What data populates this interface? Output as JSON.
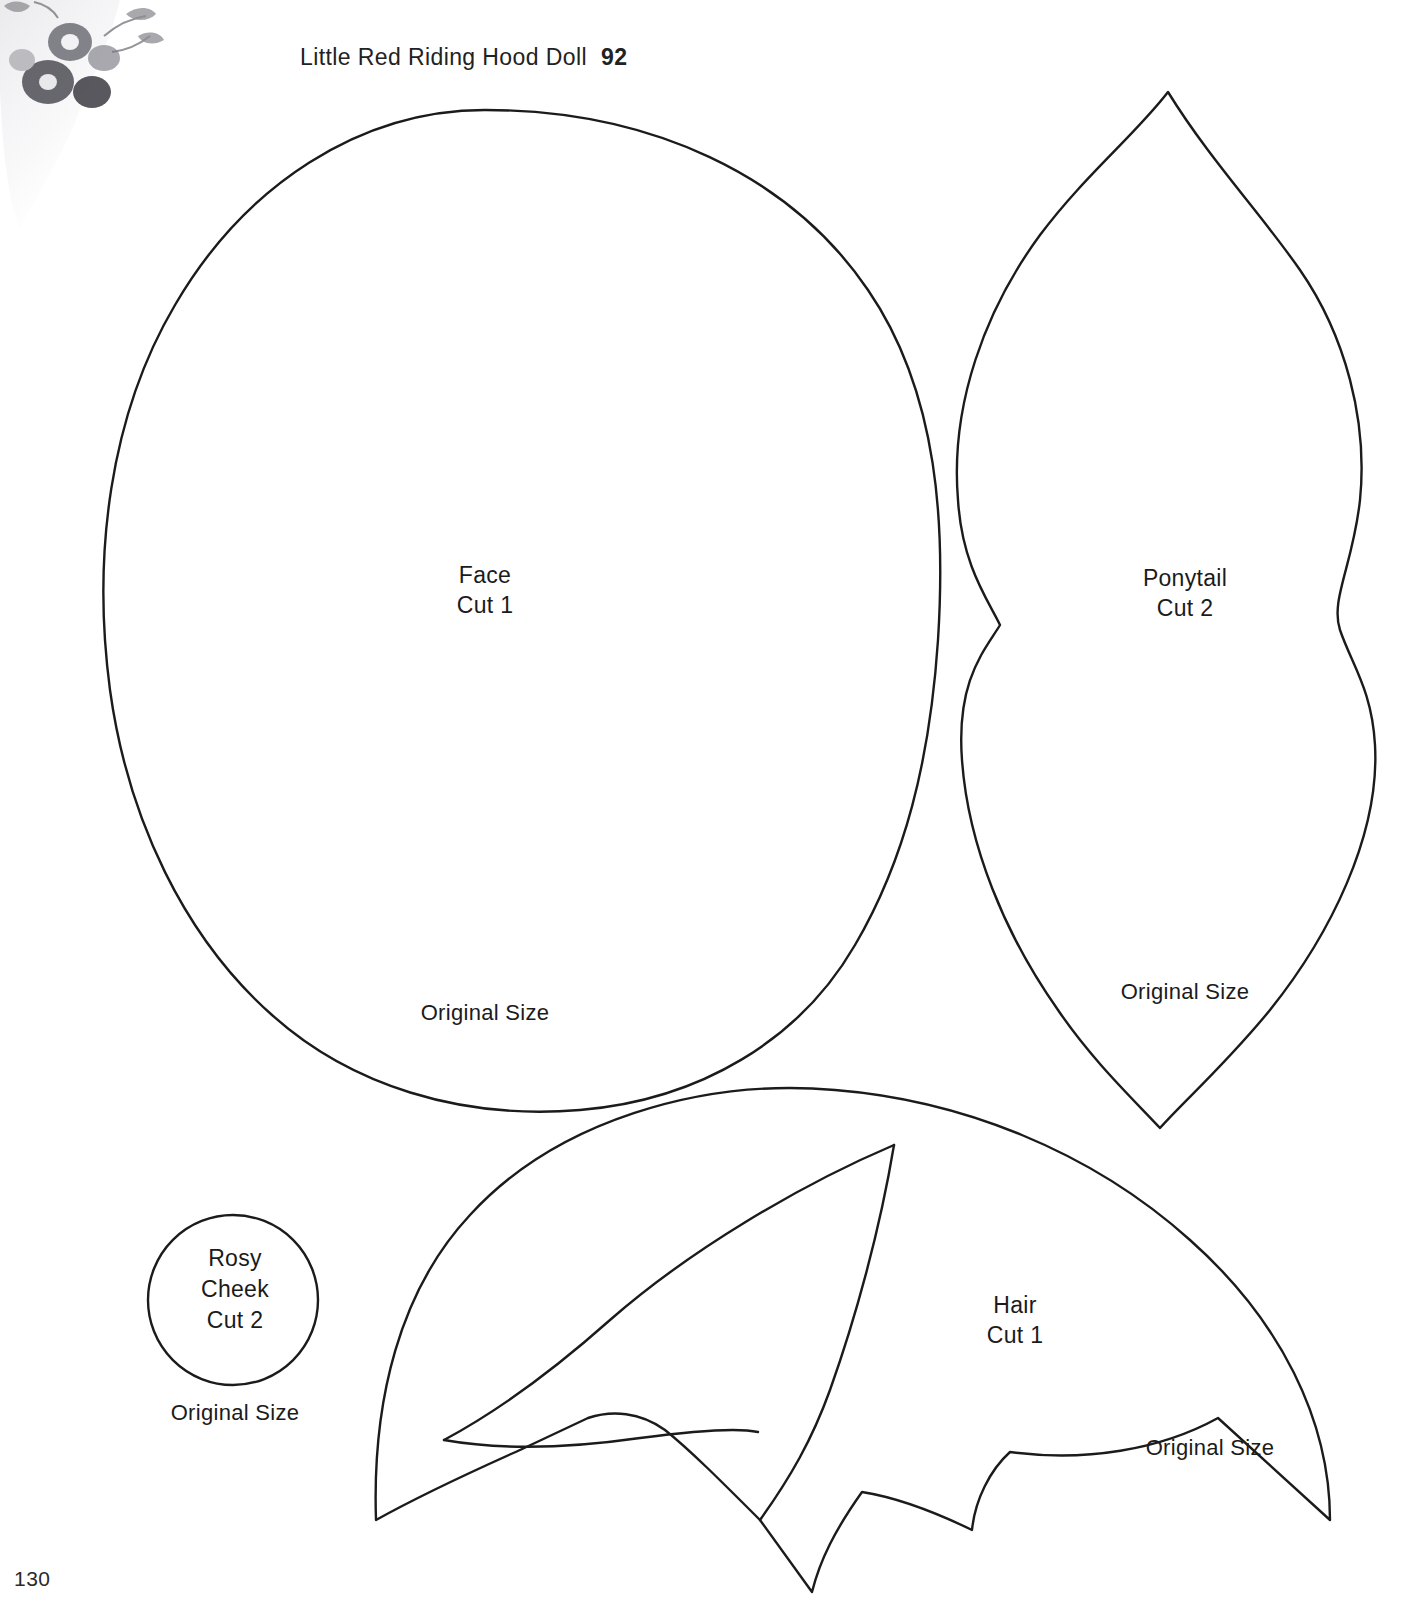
{
  "page": {
    "header_title": "Little Red Riding Hood Doll",
    "header_page": "92",
    "folio": "130"
  },
  "patterns": [
    {
      "id": "face",
      "name": "Face",
      "cut": "Cut 1",
      "label": "Face\nCut 1",
      "size_note": "Original Size"
    },
    {
      "id": "ponytail",
      "name": "Ponytail",
      "cut": "Cut 2",
      "label": "Ponytail\nCut 2",
      "size_note": "Original Size"
    },
    {
      "id": "rosy-cheek",
      "name": "Rosy Cheek",
      "cut": "Cut 2",
      "label": "Rosy\nCheek\nCut 2",
      "size_note": "Original Size"
    },
    {
      "id": "hair",
      "name": "Hair",
      "cut": "Cut 1",
      "label": "Hair\nCut 1",
      "size_note": "Original Size"
    }
  ],
  "colors": {
    "outline": "#1b1b1b",
    "page_background": "#ffffff",
    "text": "#1b1b1b",
    "floral_gray": "#8c8c92"
  }
}
